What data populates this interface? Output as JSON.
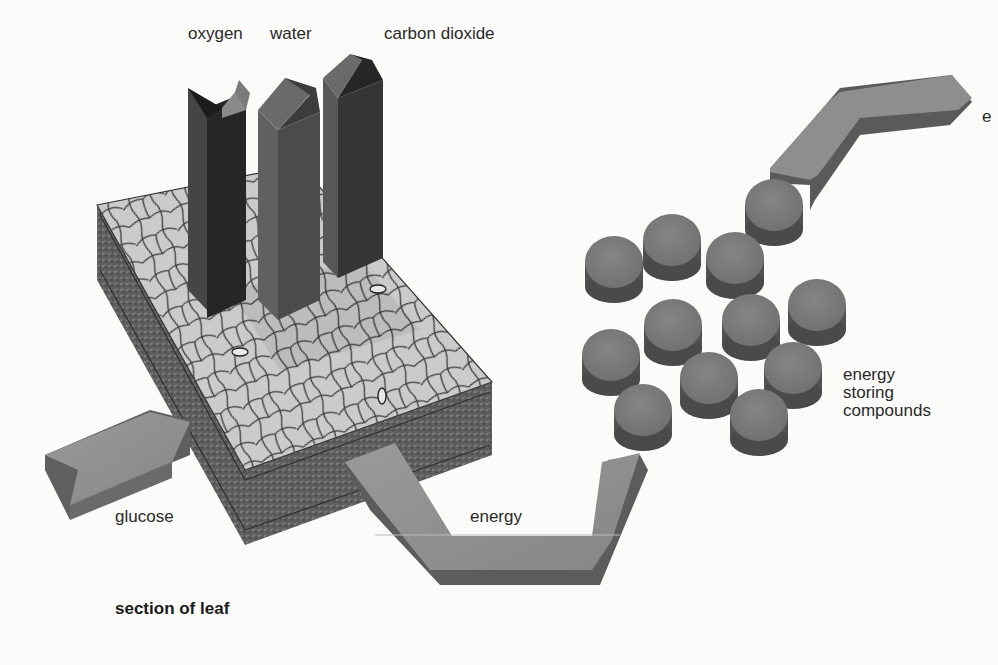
{
  "diagram": {
    "type": "process-illustration",
    "colors": {
      "background": "#fbfbfa",
      "leaf_surface": "#c9c9c9",
      "leaf_cell_lines": "#3a3a3a",
      "leaf_side": "#5a5a5a",
      "oxygen_bar": "#2b2b2b",
      "water_bar": "#555555",
      "carbon_dioxide_bar": "#3a3a3a",
      "arrow_top": "#8d8d8d",
      "arrow_side": "#5f5f5f",
      "disc_top": "#7b7b7b",
      "disc_side": "#4f4f4f"
    },
    "labels": {
      "oxygen": "oxygen",
      "water": "water",
      "carbon_dioxide": "carbon dioxide",
      "glucose": "glucose",
      "energy": "energy",
      "energy_storing_compounds": [
        "energy",
        "storing",
        "compounds"
      ],
      "section_of_leaf": "section of leaf",
      "cut_off_right": "e"
    },
    "components": [
      {
        "name": "section of leaf",
        "shape": "3D block with cell texture"
      },
      {
        "name": "oxygen",
        "shape": "vertical prism leaving leaf"
      },
      {
        "name": "water",
        "shape": "vertical prism entering leaf"
      },
      {
        "name": "carbon dioxide",
        "shape": "vertical prism entering leaf"
      },
      {
        "name": "glucose",
        "shape": "arrow entering leaf from left"
      },
      {
        "name": "energy",
        "shape": "U-shaped arrow from leaf to compounds"
      },
      {
        "name": "energy storing compounds",
        "shape": "cluster of 12 discs",
        "count": 12
      },
      {
        "name": "energy (outgoing)",
        "shape": "bent arrow leaving to upper right"
      }
    ]
  }
}
